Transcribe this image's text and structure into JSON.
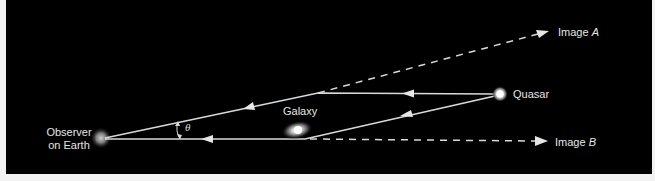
{
  "diagram": {
    "background_color": "#000000",
    "line_color": "#d9d9d9",
    "nodes": {
      "observer": {
        "label_line1": "Observer",
        "label_line2": "on Earth"
      },
      "galaxy": {
        "label": "Galaxy"
      },
      "quasar": {
        "label": "Quasar"
      }
    },
    "images": {
      "a": {
        "prefix": "Image ",
        "letter": "A"
      },
      "b": {
        "prefix": "Image ",
        "letter": "B"
      }
    },
    "angle": {
      "symbol": "θ"
    }
  }
}
